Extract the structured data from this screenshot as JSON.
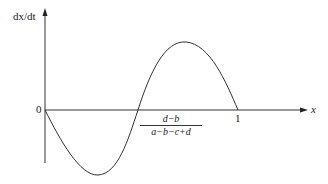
{
  "diagram": {
    "y_axis_label": "dx/dt",
    "x_axis_label": "x",
    "origin_label": "0",
    "end_label": "1",
    "root_label": {
      "numerator": "d−b",
      "denominator": "a−b−c+d"
    },
    "curve": "sinusoid-like curve starting at 0, dipping negative, crossing zero at (d-b)/(a-b-c+d), peaking positive, returning to 0 at x=1"
  }
}
